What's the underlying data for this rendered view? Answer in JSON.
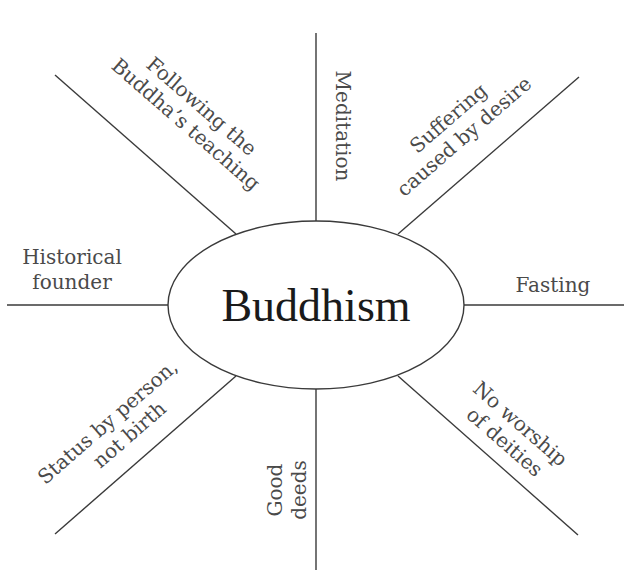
{
  "diagram": {
    "title": "Buddhism",
    "center": {
      "label": "Buddhism"
    },
    "spokes": [
      {
        "id": "top-left",
        "lines": [
          "Following the",
          "Buddha’s teaching"
        ]
      },
      {
        "id": "top",
        "lines": [
          "Meditation"
        ]
      },
      {
        "id": "top-right",
        "lines": [
          "Suffering",
          "caused by desire"
        ]
      },
      {
        "id": "right",
        "lines": [
          "Fasting"
        ]
      },
      {
        "id": "bottom-right",
        "lines": [
          "No worship",
          "of deities"
        ]
      },
      {
        "id": "bottom",
        "lines": [
          "Good",
          "deeds"
        ]
      },
      {
        "id": "bottom-left",
        "lines": [
          "Status by person,",
          "not birth"
        ]
      },
      {
        "id": "left",
        "lines": [
          "Historical",
          "founder"
        ]
      }
    ]
  }
}
